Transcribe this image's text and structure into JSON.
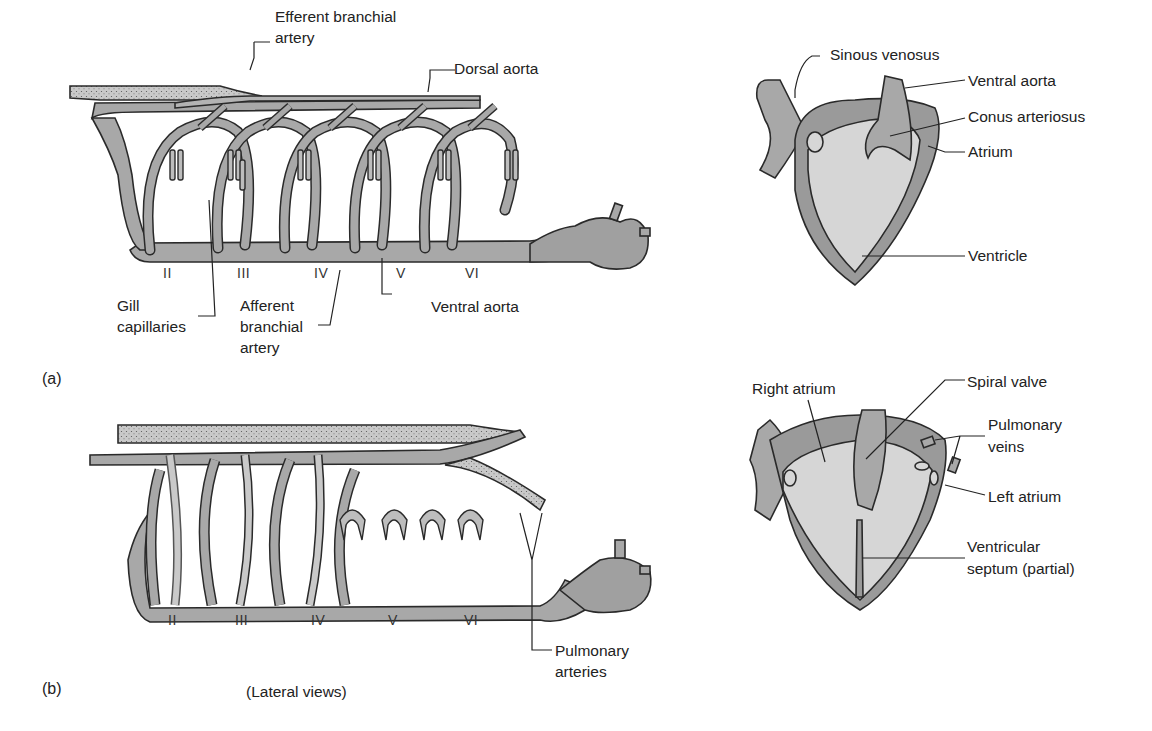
{
  "figure": {
    "panel_a": {
      "id": "(a)",
      "arch_numerals": [
        "II",
        "III",
        "IV",
        "V",
        "VI"
      ],
      "labels": {
        "efferent_branchial_artery": [
          "Efferent branchial",
          "artery"
        ],
        "dorsal_aorta": "Dorsal aorta",
        "gill_capillaries": [
          "Gill",
          "capillaries"
        ],
        "afferent_branchial_artery": [
          "Afferent",
          "branchial",
          "artery"
        ],
        "ventral_aorta": "Ventral aorta"
      },
      "heart_labels": {
        "sinous_venosus": "Sinous venosus",
        "ventral_aorta": "Ventral aorta",
        "conus_arteriosus": "Conus arteriosus",
        "atrium": "Atrium",
        "ventricle": "Ventricle"
      }
    },
    "panel_b": {
      "id": "(b)",
      "arch_numerals": [
        "II",
        "III",
        "IV",
        "V",
        "VI"
      ],
      "labels": {
        "pulmonary_arteries": [
          "Pulmonary",
          "arteries"
        ]
      },
      "heart_labels": {
        "right_atrium": "Right atrium",
        "spiral_valve": "Spiral valve",
        "pulmonary_veins": [
          "Pulmonary",
          "veins"
        ],
        "left_atrium": "Left atrium",
        "ventricular_septum": [
          "Ventricular",
          "septum (partial)"
        ]
      }
    },
    "caption": "(Lateral views)",
    "colors": {
      "vessel_fill": "#a8a8a8",
      "vessel_outline": "#2a2a2a",
      "heart_inner": "#d6d6d6",
      "heart_wall": "#9a9a9a",
      "stipple": "#c4c4c4"
    }
  }
}
